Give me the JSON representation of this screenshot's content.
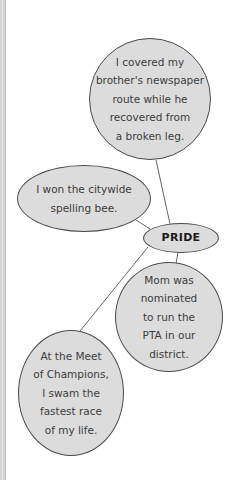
{
  "diagram": {
    "type": "concept-web",
    "center": {
      "label": "PRIDE"
    },
    "nodes": [
      {
        "id": "newspaper",
        "text": "I covered my\nbrother's newspaper\nroute while he\nrecovered from\na broken leg."
      },
      {
        "id": "spelling",
        "text": "I won the citywide\nspelling bee."
      },
      {
        "id": "pta",
        "text": "Mom was\nnominated\nto run the\nPTA in our\ndistrict."
      },
      {
        "id": "swim",
        "text": "At the Meet\nof Champions,\nI swam the\nfastest race\nof my life."
      }
    ],
    "colors": {
      "node_fill": "#dcdcdc",
      "node_border": "#4a4a4a",
      "link": "#555555",
      "text": "#3c3c3c"
    }
  }
}
